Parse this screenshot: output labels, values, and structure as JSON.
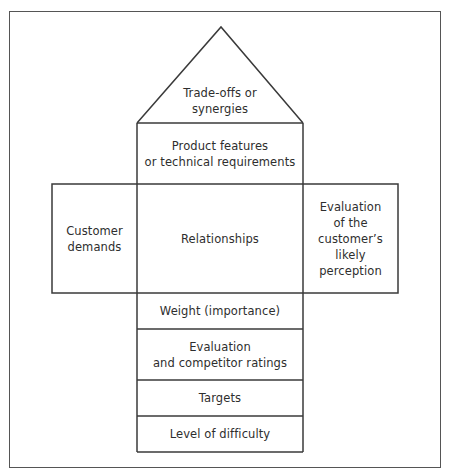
{
  "diagram": {
    "type": "house-of-quality",
    "colors": {
      "line": "#3a3a3a",
      "frame": "#555555",
      "text": "#2e2e2e",
      "background": "#ffffff"
    },
    "roof": {
      "label": "Trade-offs or\nsynergies"
    },
    "ceiling": {
      "label": "Product features\nor technical requirements"
    },
    "left_wall": {
      "label": "Customer\ndemands"
    },
    "center": {
      "label": "Relationships"
    },
    "right_wall": {
      "label": "Evaluation\nof the\ncustomer’s\nlikely\nperception"
    },
    "basement": [
      {
        "label": "Weight (importance)"
      },
      {
        "label": "Evaluation\nand competitor ratings"
      },
      {
        "label": "Targets"
      },
      {
        "label": "Level of difficulty"
      }
    ]
  }
}
